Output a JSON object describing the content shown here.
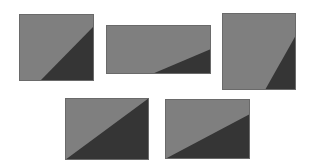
{
  "colors": {
    "background": "#ffffff",
    "light_fill": "#7f7f7f",
    "dark_fill": "#353535",
    "border": "#6a6a6a"
  },
  "shapes": [
    {
      "id": "rect-1",
      "x": 19,
      "y": 14,
      "w": 75,
      "h": 67,
      "dark_polygon": [
        [
          94,
          26
        ],
        [
          94,
          81
        ],
        [
          40,
          81
        ]
      ]
    },
    {
      "id": "rect-2",
      "x": 106,
      "y": 25,
      "w": 105,
      "h": 49,
      "dark_polygon": [
        [
          211,
          49
        ],
        [
          211,
          74
        ],
        [
          152,
          74
        ]
      ]
    },
    {
      "id": "rect-3",
      "x": 222,
      "y": 13,
      "w": 74,
      "h": 77,
      "dark_polygon": [
        [
          296,
          35
        ],
        [
          296,
          90
        ],
        [
          265,
          90
        ]
      ]
    },
    {
      "id": "rect-4",
      "x": 65,
      "y": 98,
      "w": 84,
      "h": 62,
      "dark_polygon": [
        [
          149,
          98
        ],
        [
          149,
          160
        ],
        [
          65,
          160
        ]
      ]
    },
    {
      "id": "rect-5",
      "x": 165,
      "y": 99,
      "w": 85,
      "h": 60,
      "dark_polygon": [
        [
          250,
          114
        ],
        [
          250,
          159
        ],
        [
          165,
          159
        ]
      ]
    }
  ]
}
